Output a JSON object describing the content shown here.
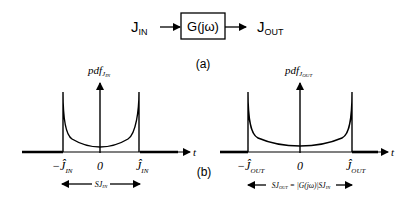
{
  "block_diagram": {
    "input_label": "J",
    "input_sub": "IN",
    "block_label": "G(jω)",
    "output_label": "J",
    "output_sub": "OUT",
    "caption": "(a)"
  },
  "plots": {
    "caption": "(b)",
    "left": {
      "y_label": "pdf",
      "y_sub": "J",
      "y_subsub": "IN",
      "x_label": "t",
      "neg_tick": "−Ĵ",
      "neg_sub": "IN",
      "zero_tick": "0",
      "pos_tick": "Ĵ",
      "pos_sub": "IN",
      "span_label": "SJ",
      "span_sub": "IN"
    },
    "right": {
      "y_label": "pdf",
      "y_sub": "J",
      "y_subsub": "OUT",
      "x_label": "t",
      "neg_tick": "−Ĵ",
      "neg_sub": "OUT",
      "zero_tick": "0",
      "pos_tick": "Ĵ",
      "pos_sub": "OUT",
      "span_label": "SJ",
      "span_sub": "OUT",
      "span_eq": " = |G(jω)|SJ",
      "span_eq_sub": "IN"
    }
  }
}
